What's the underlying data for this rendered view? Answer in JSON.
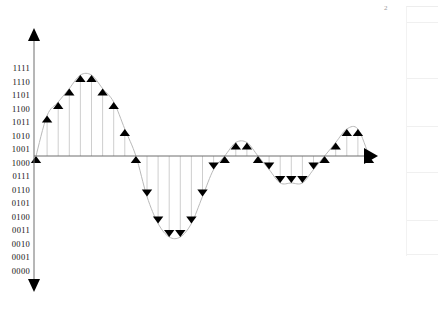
{
  "page": {
    "width": 438,
    "height": 315,
    "background": "#ffffff",
    "corner_label": "2"
  },
  "axes": {
    "x_axis": {
      "name": "horizontal-axis",
      "y_pixel": 156,
      "x_start": 34,
      "x_end": 378,
      "arrow": "right",
      "color": "#6f6f6f"
    },
    "y_axis": {
      "name": "vertical-axis",
      "x_pixel": 34,
      "y_top": 28,
      "y_bottom": 292,
      "arrow_top": "up",
      "arrow_bottom": "down",
      "color": "#6f6f6f"
    },
    "y_tick_labels": [
      "1111",
      "1110",
      "1101",
      "1100",
      "1011",
      "1010",
      "1001",
      "1000",
      "0111",
      "0110",
      "0101",
      "0100",
      "0011",
      "0010",
      "0001",
      "0000"
    ],
    "y_label_top_px": 68,
    "y_label_spacing_px": 13.5,
    "zero_level_label": "1000"
  },
  "chart_data": {
    "type": "line",
    "title": "",
    "subtitle": "",
    "xlabel": "",
    "ylabel": "",
    "grid": false,
    "legend": null,
    "marker_style": "filled-triangle",
    "marker_up_color": "#000000",
    "marker_down_color": "#000000",
    "stem_color": "#c8c8c8",
    "curve_color": "#b4b4b4",
    "encoding": "4-bit binary offset, 1000 = zero level",
    "ylim": [
      0,
      15
    ],
    "ytick_values": [
      15,
      14,
      13,
      12,
      11,
      10,
      9,
      8,
      7,
      6,
      5,
      4,
      3,
      2,
      1,
      0
    ],
    "ytick_labels": [
      "1111",
      "1110",
      "1101",
      "1100",
      "1011",
      "1010",
      "1001",
      "1000",
      "0111",
      "0110",
      "0101",
      "0100",
      "0011",
      "0010",
      "0001",
      "0000"
    ],
    "x": [
      0,
      1,
      2,
      3,
      4,
      5,
      6,
      7,
      8,
      9,
      10,
      11,
      12,
      13,
      14,
      15,
      16,
      17,
      18,
      19,
      20,
      21,
      22,
      23,
      24,
      25,
      26,
      27,
      28,
      29,
      30
    ],
    "values": [
      8,
      11,
      12,
      13,
      14,
      14,
      13,
      12,
      10,
      8,
      5,
      3,
      2,
      2,
      3,
      5,
      7,
      8,
      9,
      9,
      8,
      7,
      6,
      6,
      6,
      7,
      8,
      9,
      10,
      10,
      8
    ],
    "values_binary": [
      "1000",
      "1011",
      "1100",
      "1101",
      "1110",
      "1110",
      "1101",
      "1100",
      "1010",
      "1000",
      "0101",
      "0011",
      "0010",
      "0010",
      "0011",
      "0101",
      "0111",
      "1000",
      "1001",
      "1001",
      "1000",
      "0111",
      "0110",
      "0110",
      "0110",
      "0111",
      "1000",
      "1001",
      "1010",
      "1010",
      "1000"
    ],
    "x_pixel_start": 36,
    "x_pixel_spacing": 11.1,
    "y_pixel_zero": 156,
    "y_pixel_per_unit": 13.5
  },
  "side_panel": {
    "name": "side-panel",
    "visible": true,
    "row_count": 5,
    "rows": [
      "",
      "",
      "",
      "",
      ""
    ],
    "border_color": "#f0f0f0"
  }
}
